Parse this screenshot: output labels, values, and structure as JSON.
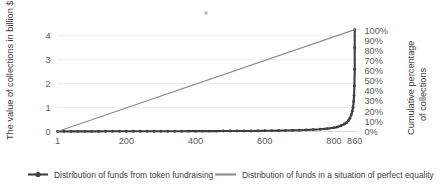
{
  "chart_data": {
    "type": "line",
    "title": "",
    "xlabel": "",
    "ylabel": "The value of collections in billion $",
    "y2label_line1": "Cumulative percentage",
    "y2label_line2": "of collections",
    "x_tick_labels": [
      "1",
      "200",
      "400",
      "600",
      "800",
      "860"
    ],
    "x_tick_values": [
      1,
      200,
      400,
      600,
      800,
      860
    ],
    "xlim": [
      1,
      868
    ],
    "y_tick_labels": [
      "0",
      "1",
      "2",
      "3",
      "4"
    ],
    "y_tick_values": [
      0,
      1,
      2,
      3,
      4
    ],
    "ylim": [
      0,
      4.55
    ],
    "y2_tick_labels": [
      "0%",
      "10%",
      "20%",
      "30%",
      "40%",
      "50%",
      "60%",
      "70%",
      "80%",
      "90%",
      "100%"
    ],
    "y2_tick_values": [
      0,
      10,
      20,
      30,
      40,
      50,
      60,
      70,
      80,
      90,
      100
    ],
    "y2lim": [
      0,
      108
    ],
    "grid": true,
    "legend_position": "bottom",
    "series": [
      {
        "name": "Distribution of funds from token fundraising",
        "label": "Distribution of funds from token fundraising",
        "color": "#3f3f3f",
        "axis": "left",
        "marker": true,
        "x": [
          1,
          20,
          40,
          60,
          80,
          100,
          120,
          140,
          160,
          180,
          200,
          220,
          240,
          260,
          280,
          300,
          320,
          340,
          360,
          380,
          400,
          420,
          440,
          460,
          480,
          500,
          520,
          540,
          560,
          580,
          600,
          620,
          640,
          660,
          680,
          700,
          720,
          740,
          760,
          780,
          800,
          810,
          820,
          830,
          836,
          842,
          846,
          850,
          853,
          855,
          857,
          858,
          859,
          860,
          860,
          860
        ],
        "y": [
          0.004,
          0.005,
          0.005,
          0.006,
          0.006,
          0.007,
          0.007,
          0.008,
          0.008,
          0.009,
          0.009,
          0.01,
          0.01,
          0.011,
          0.011,
          0.012,
          0.012,
          0.013,
          0.013,
          0.014,
          0.015,
          0.015,
          0.016,
          0.017,
          0.018,
          0.019,
          0.02,
          0.022,
          0.024,
          0.026,
          0.029,
          0.032,
          0.036,
          0.041,
          0.047,
          0.055,
          0.065,
          0.078,
          0.095,
          0.12,
          0.16,
          0.19,
          0.24,
          0.31,
          0.37,
          0.46,
          0.55,
          0.7,
          0.85,
          1.0,
          1.25,
          1.5,
          1.9,
          2.6,
          3.5,
          4.25
        ]
      },
      {
        "name": "Distribution of funds in a situation of perfect equality",
        "label": "Distribution of funds in a situation of perfect equality",
        "color": "#8c8c8c",
        "axis": "left",
        "marker": false,
        "x": [
          1,
          860
        ],
        "y": [
          0.0,
          4.25
        ]
      }
    ],
    "annotations": [
      {
        "name": "top-mark",
        "x_px": 206,
        "y_px": 13,
        "size": 3.2,
        "color": "#bdbdbd"
      }
    ]
  },
  "legend": {
    "items": [
      {
        "label": "Distribution of funds from token fundraising",
        "color": "#3f3f3f",
        "marker": true
      },
      {
        "label": "Distribution of funds in a situation of perfect equality",
        "color": "#8c8c8c",
        "marker": false
      }
    ]
  }
}
